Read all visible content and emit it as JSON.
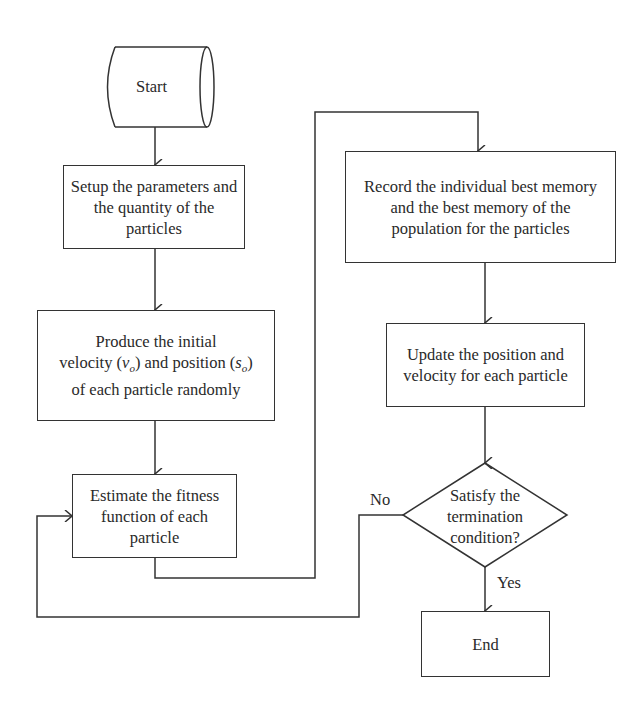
{
  "diagram": {
    "type": "flowchart",
    "nodes": {
      "start": {
        "label": "Start",
        "shape": "terminator-cylinder"
      },
      "setup": {
        "label": "Setup the parameters and the quantity of the particles",
        "shape": "process"
      },
      "produce": {
        "line1": "Produce the initial",
        "line2_a": "velocity (",
        "line2_v": "v",
        "line2_vsub": "o",
        "line2_b": ") and position (",
        "line2_s": "s",
        "line2_ssub": "o",
        "line2_c": ")",
        "line3": "of each particle randomly",
        "shape": "process"
      },
      "estimate": {
        "label": "Estimate the fitness function of each particle",
        "shape": "process"
      },
      "record": {
        "label": "Record the individual best memory and the best memory of the population for the particles",
        "shape": "process"
      },
      "update": {
        "label": "Update the position and velocity for each particle",
        "shape": "process"
      },
      "decision": {
        "line1": "Satisfy the",
        "line2": "termination",
        "line3": "condition?",
        "shape": "decision"
      },
      "end": {
        "label": "End",
        "shape": "process"
      }
    },
    "edges": [
      {
        "from": "start",
        "to": "setup"
      },
      {
        "from": "setup",
        "to": "produce"
      },
      {
        "from": "produce",
        "to": "estimate"
      },
      {
        "from": "estimate",
        "to": "record"
      },
      {
        "from": "record",
        "to": "update"
      },
      {
        "from": "update",
        "to": "decision"
      },
      {
        "from": "decision",
        "to": "end",
        "label": "Yes"
      },
      {
        "from": "decision",
        "to": "estimate",
        "label": "No"
      }
    ],
    "edge_labels": {
      "yes": "Yes",
      "no": "No"
    },
    "colors": {
      "stroke": "#333333",
      "text": "#2a2a2a",
      "background": "#ffffff"
    }
  }
}
